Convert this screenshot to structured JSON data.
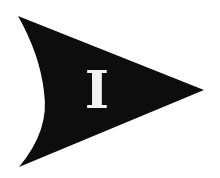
{
  "graphic": {
    "shape": "arrow-pointing-right",
    "fill_color": "#0d0d0d",
    "background_color": "#ffffff",
    "letter": "I",
    "letter_color": "#f2f2f2"
  }
}
